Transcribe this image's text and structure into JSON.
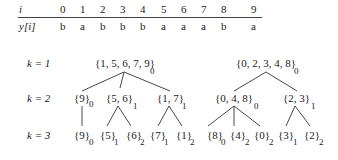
{
  "table": {
    "row_header_i": "i",
    "row_header_y": "y[i]",
    "indices": [
      "0",
      "1",
      "2",
      "3",
      "4",
      "5",
      "6",
      "7",
      "8",
      "9"
    ],
    "values": [
      "b",
      "a",
      "b",
      "b",
      "b",
      "a",
      "a",
      "a",
      "b",
      "a"
    ]
  },
  "levels": {
    "k1": "k = 1",
    "k2": "k = 2",
    "k3": "k = 3"
  },
  "tree": {
    "k1": [
      {
        "set": "{1, 5, 6, 7, 9}",
        "sub": "0"
      },
      {
        "set": "{0, 2, 3, 4, 8}",
        "sub": "0"
      }
    ],
    "k2": [
      {
        "set": "{9}",
        "sub": "0"
      },
      {
        "set": "{5, 6}",
        "sub": "1"
      },
      {
        "set": "{1, 7}",
        "sub": "1"
      },
      {
        "set": "{0, 4, 8}",
        "sub": "0"
      },
      {
        "set": "{2, 3}",
        "sub": "1"
      }
    ],
    "k3": [
      {
        "set": "{9}",
        "sub": "0"
      },
      {
        "set": "{5}",
        "sub": "1"
      },
      {
        "set": "{6}",
        "sub": "2"
      },
      {
        "set": "{7}",
        "sub": "1"
      },
      {
        "set": "{1}",
        "sub": "2"
      },
      {
        "set": "{8}",
        "sub": "0"
      },
      {
        "set": "{4}",
        "sub": "2"
      },
      {
        "set": "{0}",
        "sub": "2"
      },
      {
        "set": "{3}",
        "sub": "1"
      },
      {
        "set": "{2}",
        "sub": "2"
      }
    ]
  }
}
